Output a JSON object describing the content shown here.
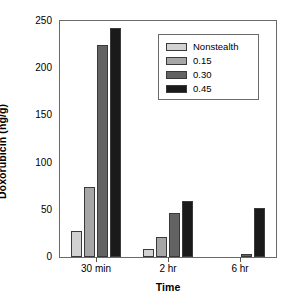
{
  "chart_data": {
    "type": "bar",
    "title": "",
    "subtitle": "",
    "xlabel": "Time",
    "ylabel": "Doxorubicin (ng/g)",
    "categories": [
      "30 min",
      "2 hr",
      "6 hr"
    ],
    "series": [
      {
        "name": "Nonstealth",
        "color": "#d2d2d2",
        "values": [
          28,
          8,
          0
        ]
      },
      {
        "name": "0.15",
        "color": "#a6a6a6",
        "values": [
          74,
          21,
          0
        ]
      },
      {
        "name": "0.30",
        "color": "#636363",
        "values": [
          225,
          47,
          3
        ]
      },
      {
        "name": "0.45",
        "color": "#1a1a1a",
        "values": [
          243,
          59,
          52
        ]
      }
    ],
    "ylim": [
      0,
      250
    ],
    "yticks": [
      0,
      50,
      100,
      150,
      200,
      250
    ],
    "ytick_labels": [
      "0",
      "50",
      "100",
      "150",
      "200",
      "250"
    ],
    "grid": false,
    "legend_position": "upper center",
    "legend_entries": [
      "Nonstealth",
      "0.15",
      "0.30",
      "0.45"
    ]
  },
  "axes": {
    "y_title": "Doxorubicin (ng/g)",
    "x_title": "Time"
  }
}
